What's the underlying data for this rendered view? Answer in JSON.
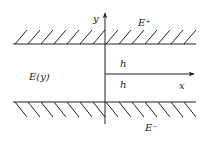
{
  "diagram": {
    "type": "channel-flow-schematic",
    "labels": {
      "y_axis": "y",
      "x_axis": "x",
      "upper_region": "E⁺",
      "lower_region": "E⁻",
      "channel": "E(y)",
      "upper_half_height": "h",
      "lower_half_height": "h"
    },
    "geometry": {
      "upper_wall_y": 44,
      "lower_wall_y": 102,
      "wall_x_start": 13,
      "wall_x_end": 196,
      "axis_origin_x": 105,
      "axis_origin_y": 74,
      "hatch_count": 14,
      "hatch_spacing": 13
    },
    "colors": {
      "line": "#222222",
      "background": "#ffffff"
    }
  }
}
